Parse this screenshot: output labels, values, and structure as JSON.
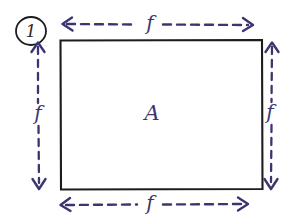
{
  "figure": {
    "kind": "hand-drawn-free-body-diagram",
    "background_color": "#ffffff",
    "ink_blue": "#3b3570",
    "ink_black": "#1c1c1c",
    "problem_number": "1",
    "body_label": "A",
    "force_top_label": "f",
    "force_bottom_label": "f",
    "force_left_label": "f",
    "force_right_label": "f"
  },
  "annotations": {
    "problem_badge_shape": "circle",
    "arrow_style": "dashed double-headed",
    "rectangle_style": "solid outline"
  }
}
